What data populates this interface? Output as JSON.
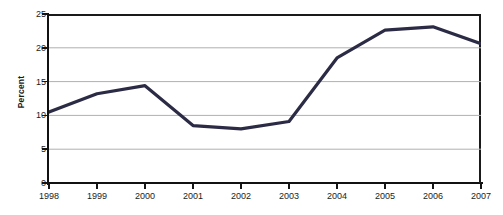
{
  "chart_data": {
    "type": "line",
    "title": "",
    "xlabel": "",
    "ylabel": "Percent",
    "categories": [
      "1998",
      "1999",
      "2000",
      "2001",
      "2002",
      "2003",
      "2004",
      "2005",
      "2006",
      "2007"
    ],
    "x": [
      1998,
      1999,
      2000,
      2001,
      2002,
      2003,
      2004,
      2005,
      2006,
      2007
    ],
    "series": [
      {
        "name": "Percent",
        "values": [
          10.5,
          13.2,
          14.4,
          8.5,
          8.0,
          9.1,
          18.5,
          22.6,
          23.1,
          20.6
        ],
        "color": "#2b2b45"
      }
    ],
    "ylim": [
      0,
      25
    ],
    "yticks": [
      0,
      5,
      10,
      15,
      20,
      25
    ],
    "ytick_labels": [
      "0",
      "5",
      "10",
      "15",
      "20",
      "25"
    ],
    "xtick_labels": [
      "1998",
      "1999",
      "2000",
      "2001",
      "2002",
      "2003",
      "2004",
      "2005",
      "2006",
      "2007"
    ],
    "grid": true,
    "grid_axis": "y",
    "grid_color": "#b0b0b0",
    "legend": false,
    "legend_position": "none",
    "axis_color": "#111111",
    "background": "#ffffff",
    "line_width": 3.2,
    "markers": false
  }
}
